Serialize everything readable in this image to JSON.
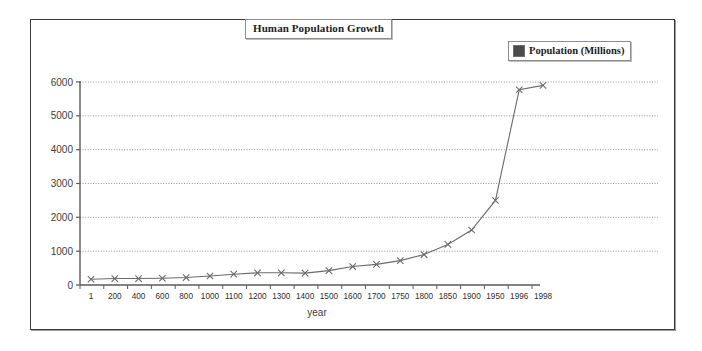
{
  "chart_data": {
    "type": "line",
    "title": "Human Population Growth",
    "xlabel": "year",
    "ylabel": "",
    "ylim": [
      0,
      6000
    ],
    "yticks": [
      0,
      1000,
      2000,
      3000,
      4000,
      5000,
      6000
    ],
    "grid": true,
    "legend_position": "top-right",
    "legend": [
      "Population (Millions)"
    ],
    "marker": "x",
    "series_color": "#6b6b6b",
    "categories": [
      "1",
      "200",
      "400",
      "600",
      "800",
      "1000",
      "1100",
      "1200",
      "1300",
      "1400",
      "1500",
      "1600",
      "1700",
      "1750",
      "1800",
      "1850",
      "1900",
      "1950",
      "1996",
      "1998"
    ],
    "series": [
      {
        "name": "Population (Millions)",
        "values": [
          170,
          190,
          190,
          200,
          220,
          265,
          320,
          360,
          360,
          350,
          425,
          545,
          610,
          720,
          900,
          1200,
          1625,
          2500,
          5770,
          5900
        ]
      }
    ]
  },
  "chart": {
    "title": "Human Population Growth",
    "legend_entry": "Population (Millions)",
    "legend_swatch_color": "#4b4b4b",
    "x_axis_title": "year",
    "y_tick_labels": [
      "0",
      "1000",
      "2000",
      "3000",
      "4000",
      "5000",
      "6000"
    ],
    "x_tick_labels": [
      "1",
      "200",
      "400",
      "600",
      "800",
      "1000",
      "1100",
      "1200",
      "1300",
      "1400",
      "1500",
      "1600",
      "1700",
      "1750",
      "1800",
      "1850",
      "1900",
      "1950",
      "1996",
      "1998"
    ]
  }
}
